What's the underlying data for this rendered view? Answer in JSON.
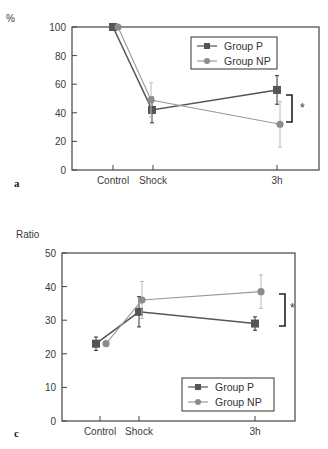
{
  "colors": {
    "group_p": "#555555",
    "group_np": "#9a9a9a",
    "axis": "#444444",
    "bracket": "#222222"
  },
  "chart_data": [
    {
      "panel": "a",
      "type": "line",
      "title": "",
      "xlabel": "",
      "ylabel": "%",
      "ylim": [
        0,
        100
      ],
      "yticks": [
        0,
        20,
        40,
        60,
        80,
        100
      ],
      "categories": [
        "Control",
        "Shock",
        "3h"
      ],
      "legend_position": "upper right",
      "grid": false,
      "series": [
        {
          "name": "Group P",
          "marker": "square",
          "values": [
            100,
            42,
            56
          ],
          "errors": [
            0,
            9,
            10
          ]
        },
        {
          "name": "Group NP",
          "marker": "circle",
          "values": [
            100,
            49,
            32
          ],
          "errors": [
            0,
            12,
            16
          ]
        }
      ],
      "annotations": [
        {
          "type": "significance-bracket",
          "at": "3h",
          "text": "*"
        }
      ]
    },
    {
      "panel": "c",
      "type": "line",
      "title": "",
      "xlabel": "",
      "ylabel": "Ratio",
      "ylim": [
        0,
        50
      ],
      "yticks": [
        0,
        10,
        20,
        30,
        40,
        50
      ],
      "categories": [
        "Control",
        "Shock",
        "3h"
      ],
      "legend_position": "lower right",
      "grid": false,
      "series": [
        {
          "name": "Group P",
          "marker": "square",
          "values": [
            23,
            32.5,
            29
          ],
          "errors": [
            2,
            4.5,
            2
          ]
        },
        {
          "name": "Group NP",
          "marker": "circle",
          "values": [
            23,
            36,
            38.5
          ],
          "errors": [
            0.5,
            5.5,
            5
          ]
        }
      ],
      "annotations": [
        {
          "type": "significance-bracket",
          "at": "3h",
          "text": "*"
        }
      ]
    }
  ],
  "layout": [
    {
      "box": {
        "x0": 72,
        "x1": 319,
        "y0": 27,
        "y1": 170
      },
      "xpos": [
        113,
        153,
        277
      ],
      "np_offset": [
        5,
        -2,
        3
      ],
      "p_offset": [
        0,
        -1,
        0
      ],
      "legend": {
        "x": 191,
        "y": 37,
        "w": 86,
        "h": 32
      },
      "bracket": {
        "x": 292,
        "y0": 95,
        "y1": 122,
        "star_x": 300,
        "star_y": 112
      },
      "ylabel_pos": {
        "x": 6,
        "y": 22
      },
      "panel_pos": {
        "x": 14,
        "y": 187
      }
    },
    {
      "box": {
        "x0": 62,
        "x1": 295,
        "y0": 253,
        "y1": 421
      },
      "xpos": [
        100,
        139,
        255
      ],
      "np_offset": [
        6,
        3,
        6
      ],
      "p_offset": [
        -4,
        0,
        0
      ],
      "legend": {
        "x": 182,
        "y": 378,
        "w": 92,
        "h": 33
      },
      "bracket": {
        "x": 285,
        "y0": 294,
        "y1": 326,
        "star_x": 290,
        "star_y": 312
      },
      "ylabel_pos": {
        "x": 16,
        "y": 238
      },
      "panel_pos": {
        "x": 14,
        "y": 437
      }
    }
  ]
}
